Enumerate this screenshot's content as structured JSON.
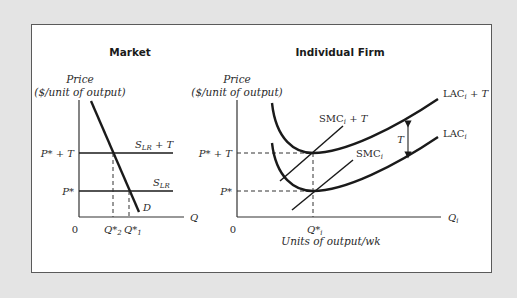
{
  "market": {
    "title": "Market",
    "y_axis_title_line1": "Price",
    "y_axis_title_line2": "($/unit of output)",
    "x_axis_label": "Q",
    "origin": "0",
    "price_high": "P* + T",
    "price_low": "P*",
    "supply_tax_label_main": "S",
    "supply_tax_label_sub": "LR",
    "supply_tax_label_suffix": " + T",
    "supply_label_main": "S",
    "supply_label_sub": "LR",
    "demand_label": "D",
    "q2_label_main": "Q*",
    "q2_label_sub": "2",
    "q1_label_main": "Q*",
    "q1_label_sub": "1"
  },
  "firm": {
    "title": "Individual Firm",
    "y_axis_title_line1": "Price",
    "y_axis_title_line2": "($/unit of output)",
    "x_axis_label_main": "Q",
    "x_axis_label_sub": "i",
    "x_axis_title": "Units of output/wk",
    "origin": "0",
    "price_high": "P* + T",
    "price_low": "P*",
    "qi_label_main": "Q*",
    "qi_label_sub": "i",
    "smc_tax_main": "SMC",
    "smc_tax_sub": "i",
    "smc_tax_suffix": " + T",
    "smc_main": "SMC",
    "smc_sub": "i",
    "lac_tax_main": "LAC",
    "lac_tax_sub": "i",
    "lac_tax_suffix": " + T",
    "lac_main": "LAC",
    "lac_sub": "i",
    "tax_arrow_label": "T"
  },
  "colors": {
    "background": "#e4e4e4",
    "panel": "#ffffff",
    "ink": "#1a1a1a"
  }
}
